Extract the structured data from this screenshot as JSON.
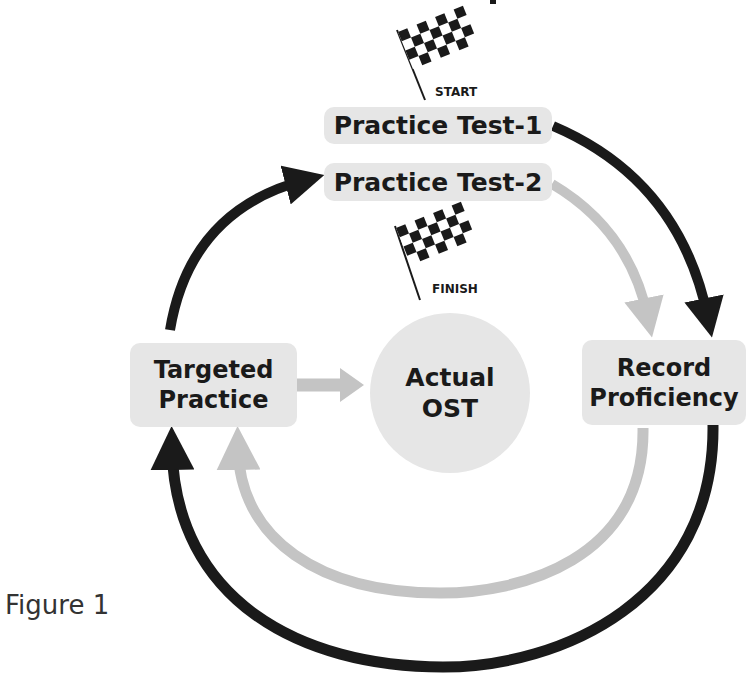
{
  "diagram": {
    "title_fragment": "",
    "start_flag": {
      "label": "START",
      "icon": "checkered-flag-icon"
    },
    "finish_flag": {
      "label": "FINISH",
      "icon": "checkered-flag-icon"
    },
    "nodes": {
      "practice_test_1": "Practice Test-1",
      "practice_test_2": "Practice Test-2",
      "targeted_practice": [
        "Targeted",
        "Practice"
      ],
      "actual_ost": [
        "Actual",
        "OST"
      ],
      "record_proficiency": [
        "Record",
        "Proficiency"
      ]
    },
    "edges": [
      {
        "from": "Practice Test-1",
        "to": "Record Proficiency",
        "color": "#1a1a1a"
      },
      {
        "from": "Practice Test-2",
        "to": "Record Proficiency",
        "color": "#c4c4c4"
      },
      {
        "from": "Record Proficiency",
        "to": "Targeted Practice",
        "color": "#c4c4c4"
      },
      {
        "from": "Record Proficiency",
        "to": "Targeted Practice",
        "color": "#1a1a1a"
      },
      {
        "from": "Targeted Practice",
        "to": "Practice Test-2",
        "color": "#1a1a1a"
      },
      {
        "from": "Targeted Practice",
        "to": "Actual OST",
        "color": "#c4c4c4"
      }
    ],
    "colors": {
      "dark": "#1a1a1a",
      "light": "#c4c4c4",
      "box": "#e6e6e6"
    }
  },
  "caption": "Figure 1"
}
